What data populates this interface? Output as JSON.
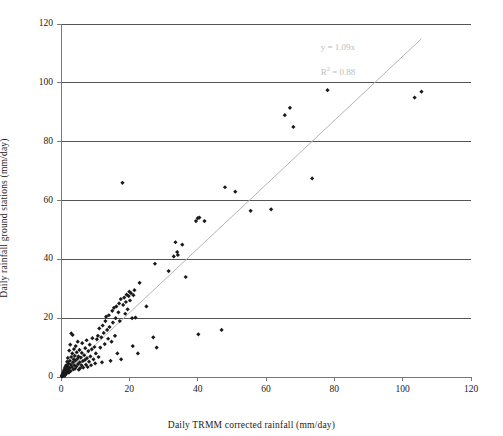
{
  "chart_data": {
    "type": "scatter",
    "title": "",
    "xlabel": "Daily TRMM corrected rainfall (mm/day)",
    "ylabel": "Daily rainfall ground stations (mm/day)",
    "xlim": [
      0,
      120
    ],
    "ylim": [
      0,
      120
    ],
    "xticks": [
      0,
      20,
      40,
      60,
      80,
      100,
      120
    ],
    "yticks": [
      0,
      20,
      40,
      60,
      80,
      100,
      120
    ],
    "grid": "horizontal",
    "legend": "none",
    "marker": "diamond",
    "marker_color": "#1a1a1a",
    "annotations": [
      {
        "name": "slope-equation",
        "text": "y = 1.09x",
        "x": 76,
        "y": 112,
        "color": "#bdbdbd"
      },
      {
        "name": "r-squared",
        "text_prefix": "R",
        "text_sup": "2",
        "text_suffix": " = 0.88",
        "x": 76,
        "y": 104,
        "color": "#bdbdbd"
      }
    ],
    "trendline": {
      "name": "linear-fit-line",
      "equation": "y = 1.09x",
      "slope": 1.09,
      "intercept": 0,
      "r_squared": 0.88,
      "color": "#b5b5b5",
      "x_start": 0,
      "x_end": 105.5
    },
    "points": [
      [
        0.2,
        0.3
      ],
      [
        0.3,
        0.6
      ],
      [
        0.4,
        0.2
      ],
      [
        0.5,
        1.0
      ],
      [
        0.5,
        0.4
      ],
      [
        0.6,
        1.4
      ],
      [
        0.7,
        0.5
      ],
      [
        0.8,
        2.0
      ],
      [
        0.9,
        1.1
      ],
      [
        1.0,
        0.4
      ],
      [
        1.0,
        2.6
      ],
      [
        1.1,
        1.6
      ],
      [
        1.2,
        3.3
      ],
      [
        1.3,
        0.8
      ],
      [
        1.4,
        2.2
      ],
      [
        1.5,
        4.0
      ],
      [
        1.6,
        1.2
      ],
      [
        1.7,
        2.9
      ],
      [
        1.8,
        5.2
      ],
      [
        1.9,
        1.9
      ],
      [
        2.0,
        3.6
      ],
      [
        2.0,
        6.5
      ],
      [
        2.1,
        2.4
      ],
      [
        2.2,
        4.5
      ],
      [
        2.3,
        1.5
      ],
      [
        2.4,
        9.0
      ],
      [
        2.5,
        3.1
      ],
      [
        2.6,
        5.5
      ],
      [
        2.7,
        11.0
      ],
      [
        2.8,
        2.0
      ],
      [
        2.9,
        4.2
      ],
      [
        3.0,
        6.8
      ],
      [
        3.0,
        14.8
      ],
      [
        3.2,
        3.4
      ],
      [
        3.3,
        8.0
      ],
      [
        3.4,
        14.3
      ],
      [
        3.5,
        5.0
      ],
      [
        3.6,
        2.6
      ],
      [
        3.7,
        6.0
      ],
      [
        3.8,
        9.5
      ],
      [
        3.9,
        4.0
      ],
      [
        4.0,
        7.2
      ],
      [
        4.1,
        2.8
      ],
      [
        4.2,
        5.6
      ],
      [
        4.3,
        10.5
      ],
      [
        4.5,
        3.6
      ],
      [
        4.6,
        8.4
      ],
      [
        4.8,
        6.2
      ],
      [
        4.9,
        12.0
      ],
      [
        5.0,
        4.4
      ],
      [
        5.1,
        7.0
      ],
      [
        5.2,
        2.5
      ],
      [
        5.4,
        9.2
      ],
      [
        5.5,
        5.0
      ],
      [
        5.6,
        3.0
      ],
      [
        5.8,
        6.6
      ],
      [
        6.0,
        4.0
      ],
      [
        6.1,
        8.2
      ],
      [
        6.2,
        11.5
      ],
      [
        6.4,
        5.4
      ],
      [
        6.5,
        3.2
      ],
      [
        6.8,
        7.4
      ],
      [
        7.0,
        5.8
      ],
      [
        7.1,
        9.8
      ],
      [
        7.3,
        4.2
      ],
      [
        7.5,
        12.5
      ],
      [
        7.6,
        6.4
      ],
      [
        7.8,
        3.4
      ],
      [
        8.0,
        8.8
      ],
      [
        8.2,
        5.2
      ],
      [
        8.4,
        11.0
      ],
      [
        8.6,
        7.0
      ],
      [
        8.8,
        4.0
      ],
      [
        9.0,
        9.4
      ],
      [
        9.2,
        13.2
      ],
      [
        9.5,
        6.0
      ],
      [
        9.8,
        10.2
      ],
      [
        10.0,
        4.6
      ],
      [
        10.2,
        8.0
      ],
      [
        10.5,
        12.8
      ],
      [
        10.8,
        14.0
      ],
      [
        11.0,
        6.8
      ],
      [
        11.2,
        16.5
      ],
      [
        11.5,
        10.0
      ],
      [
        11.8,
        13.5
      ],
      [
        12.0,
        5.0
      ],
      [
        12.2,
        17.5
      ],
      [
        12.5,
        15.0
      ],
      [
        12.8,
        11.2
      ],
      [
        13.0,
        19.0
      ],
      [
        13.2,
        20.5
      ],
      [
        13.5,
        16.0
      ],
      [
        13.8,
        13.0
      ],
      [
        14.0,
        21.0
      ],
      [
        14.2,
        17.0
      ],
      [
        14.5,
        5.5
      ],
      [
        14.8,
        12.0
      ],
      [
        15.0,
        22.5
      ],
      [
        15.2,
        18.5
      ],
      [
        15.5,
        23.5
      ],
      [
        15.8,
        14.0
      ],
      [
        16.0,
        20.0
      ],
      [
        16.2,
        24.0
      ],
      [
        16.5,
        8.0
      ],
      [
        16.8,
        22.0
      ],
      [
        17.0,
        25.0
      ],
      [
        17.2,
        19.0
      ],
      [
        17.5,
        26.5
      ],
      [
        17.6,
        6.0
      ],
      [
        18.0,
        66.0
      ],
      [
        18.2,
        24.5
      ],
      [
        18.5,
        27.0
      ],
      [
        18.8,
        21.5
      ],
      [
        19.0,
        25.5
      ],
      [
        19.2,
        28.0
      ],
      [
        19.5,
        23.0
      ],
      [
        19.8,
        27.5
      ],
      [
        20.0,
        29.0
      ],
      [
        20.2,
        26.0
      ],
      [
        20.5,
        28.5
      ],
      [
        20.8,
        20.0
      ],
      [
        21.0,
        10.5
      ],
      [
        21.2,
        27.8
      ],
      [
        21.5,
        29.5
      ],
      [
        21.8,
        20.2
      ],
      [
        22.5,
        8.0
      ],
      [
        23.0,
        32.0
      ],
      [
        25.0,
        24.0
      ],
      [
        27.0,
        13.5
      ],
      [
        27.5,
        38.5
      ],
      [
        28.0,
        10.0
      ],
      [
        31.5,
        36.0
      ],
      [
        33.0,
        41.0
      ],
      [
        33.5,
        45.8
      ],
      [
        34.0,
        42.5
      ],
      [
        34.2,
        41.5
      ],
      [
        35.5,
        45.0
      ],
      [
        36.5,
        34.0
      ],
      [
        39.5,
        53.0
      ],
      [
        40.0,
        54.0
      ],
      [
        40.5,
        54.2
      ],
      [
        40.2,
        14.5
      ],
      [
        42.0,
        53.0
      ],
      [
        47.0,
        16.0
      ],
      [
        48.0,
        64.5
      ],
      [
        51.0,
        63.0
      ],
      [
        55.5,
        56.5
      ],
      [
        61.5,
        57.0
      ],
      [
        65.5,
        89.0
      ],
      [
        67.0,
        91.5
      ],
      [
        68.0,
        85.0
      ],
      [
        73.5,
        67.5
      ],
      [
        78.0,
        97.5
      ],
      [
        103.5,
        95.0
      ],
      [
        105.5,
        97.0
      ]
    ]
  }
}
